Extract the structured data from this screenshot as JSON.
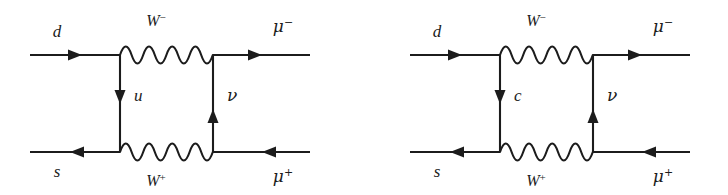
{
  "figure": {
    "name": "box-diagrams-kaon-mixing",
    "background_color": "#ffffff",
    "ink_color": "#1c1c1c"
  },
  "diagrams": [
    {
      "id": "left",
      "incoming_top_label": "d",
      "incoming_bottom_label": "s",
      "outgoing_top_label": "μ",
      "outgoing_top_charge": "−",
      "outgoing_bottom_label": "μ",
      "outgoing_bottom_charge": "+",
      "top_boson_label": "W",
      "top_boson_charge": "−",
      "bottom_boson_label": "W",
      "bottom_boson_charge": "+",
      "left_internal_label": "u",
      "right_internal_label": "ν",
      "left_internal_direction": "down",
      "right_internal_direction": "up",
      "top_line_direction": "right",
      "bottom_line_direction": "left"
    },
    {
      "id": "right",
      "incoming_top_label": "d",
      "incoming_bottom_label": "s",
      "outgoing_top_label": "μ",
      "outgoing_top_charge": "−",
      "outgoing_bottom_label": "μ",
      "outgoing_bottom_charge": "+",
      "top_boson_label": "W",
      "top_boson_charge": "−",
      "bottom_boson_label": "W",
      "bottom_boson_charge": "+",
      "left_internal_label": "c",
      "right_internal_label": "ν",
      "left_internal_direction": "down",
      "right_internal_direction": "up",
      "top_line_direction": "right",
      "bottom_line_direction": "left"
    }
  ]
}
